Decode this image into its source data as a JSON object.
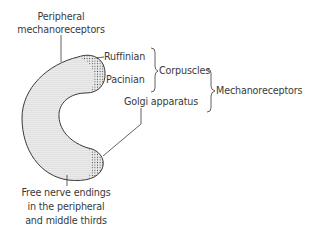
{
  "diagram": {
    "labels": {
      "peripheral": [
        "Peripheral",
        "mechanoreceptors"
      ],
      "ruffinian": "Ruffinian",
      "pacinian": "Pacinian",
      "corpuscles": "Corpuscles",
      "golgi": "Golgi apparatus",
      "mechanoreceptors": "Mechanoreceptors",
      "free_nerve": [
        "Free nerve endings",
        "in the peripheral",
        "and middle thirds"
      ]
    },
    "colors": {
      "outline": "#3a3a3a",
      "fill": "#e6e6e6",
      "dots": "#444444",
      "text": "#3a3a3a"
    }
  }
}
